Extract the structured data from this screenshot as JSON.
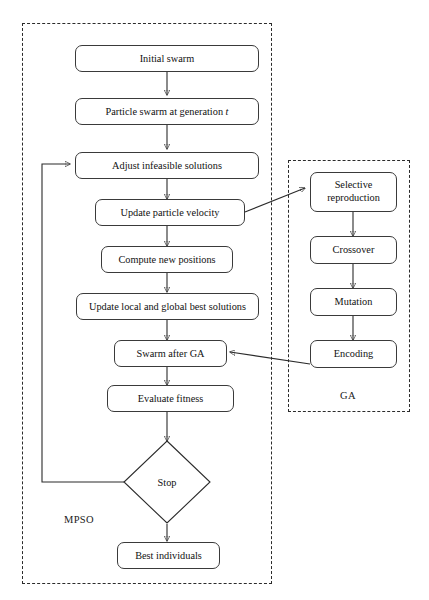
{
  "figure": {
    "type": "flowchart",
    "title": "",
    "groups": [
      {
        "id": "mpso",
        "label": "MPSO"
      },
      {
        "id": "ga",
        "label": "GA"
      }
    ],
    "nodes": {
      "initial_swarm": "Initial swarm",
      "particle_swarm_generation": "Particle swarm at generation t",
      "adjust_infeasible": "Adjust infeasible solutions",
      "update_velocity": "Update particle velocity",
      "compute_positions": "Compute new positions",
      "update_best": "Update local and global best solutions",
      "swarm_after_ga": "Swarm after GA",
      "evaluate_fitness": "Evaluate fitness",
      "stop": "Stop",
      "best_individuals": "Best individuals",
      "selective_reproduction_line1": "Selective",
      "selective_reproduction_line2": "reproduction",
      "crossover": "Crossover",
      "mutation": "Mutation",
      "encoding": "Encoding"
    },
    "colors": {
      "stroke": "#2b2b2b",
      "node_border": "#3a3a3a",
      "background": "#ffffff",
      "text": "#111111"
    }
  }
}
